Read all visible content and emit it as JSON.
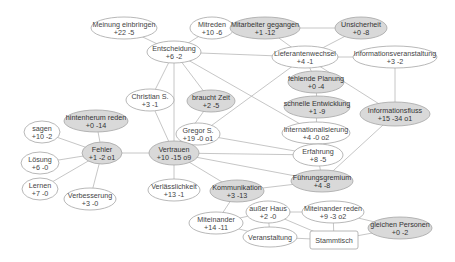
{
  "diagram": {
    "colors": {
      "edge": "#b8b8b8",
      "node_stroke": "#a6a6a6",
      "node_fill_white": "#ffffff",
      "node_fill_gray": "#d9d9d9",
      "text": "#444444"
    },
    "nodes": [
      {
        "id": "meinung",
        "line1": "Meinung einbringen",
        "line2": "+22 -5",
        "x": 124,
        "y": 28,
        "rx": 33,
        "ry": 11,
        "fill": "white"
      },
      {
        "id": "mitreden",
        "line1": "Mitreden",
        "line2": "+10 -6",
        "x": 212,
        "y": 28,
        "rx": 22,
        "ry": 11,
        "fill": "white"
      },
      {
        "id": "mitarbeiter",
        "line1": "Mitarbeiter gegangen",
        "line2": "+1 -12",
        "x": 265,
        "y": 28,
        "rx": 35,
        "ry": 11,
        "fill": "gray"
      },
      {
        "id": "unsicherheit",
        "line1": "Unsicherheit",
        "line2": "+0 -8",
        "x": 361,
        "y": 28,
        "rx": 26,
        "ry": 11,
        "fill": "gray"
      },
      {
        "id": "entscheidung",
        "line1": "Entscheidung",
        "line2": "+6 -2",
        "x": 174,
        "y": 52,
        "rx": 27,
        "ry": 11,
        "fill": "white"
      },
      {
        "id": "lieferanten",
        "line1": "Lieferantenwechsel",
        "line2": "+4 -1",
        "x": 305,
        "y": 57,
        "rx": 33,
        "ry": 11,
        "fill": "white"
      },
      {
        "id": "infoveranst",
        "line1": "Informationsveranstaltung",
        "line2": "+3 -2",
        "x": 395,
        "y": 57,
        "rx": 42,
        "ry": 11,
        "fill": "white"
      },
      {
        "id": "planung",
        "line1": "fehlende Planung",
        "line2": "+0 -4",
        "x": 316,
        "y": 82,
        "rx": 28,
        "ry": 11,
        "fill": "gray"
      },
      {
        "id": "christian",
        "line1": "Christian S.",
        "line2": "+3 -1",
        "x": 150,
        "y": 100,
        "rx": 24,
        "ry": 11,
        "fill": "white"
      },
      {
        "id": "zeit",
        "line1": "braucht Zeit",
        "line2": "+2 -5",
        "x": 211,
        "y": 101,
        "rx": 24,
        "ry": 11,
        "fill": "gray"
      },
      {
        "id": "entwicklung",
        "line1": "schnelle Entwicklung",
        "line2": "+1 -9",
        "x": 317,
        "y": 107,
        "rx": 33,
        "ry": 11,
        "fill": "gray"
      },
      {
        "id": "infofluss",
        "line1": "Informationsfluss",
        "line2": "+15 -34 o1",
        "x": 395,
        "y": 114,
        "rx": 35,
        "ry": 12,
        "fill": "gray"
      },
      {
        "id": "hintenherum",
        "line1": "hintenherum reden",
        "line2": "+0 -14",
        "x": 96,
        "y": 121,
        "rx": 32,
        "ry": 11,
        "fill": "gray"
      },
      {
        "id": "sagen",
        "line1": "sagen",
        "line2": "+10 -2",
        "x": 42,
        "y": 132,
        "rx": 18,
        "ry": 11,
        "fill": "white"
      },
      {
        "id": "gregor",
        "line1": "Gregor S.",
        "line2": "+19 -0 o1",
        "x": 198,
        "y": 134,
        "rx": 22,
        "ry": 11,
        "fill": "white"
      },
      {
        "id": "international",
        "line1": "Internationalisierung",
        "line2": "+4 -0 o2",
        "x": 316,
        "y": 133,
        "rx": 34,
        "ry": 11,
        "fill": "white"
      },
      {
        "id": "fehler",
        "line1": "Fehler",
        "line2": "+1 -2 o1",
        "x": 102,
        "y": 153,
        "rx": 20,
        "ry": 11,
        "fill": "gray"
      },
      {
        "id": "vertrauen",
        "line1": "Vertrauen",
        "line2": "+10 -15 o9",
        "x": 174,
        "y": 153,
        "rx": 25,
        "ry": 12,
        "fill": "gray"
      },
      {
        "id": "erfahrung",
        "line1": "Erfahrung",
        "line2": "+8 -5",
        "x": 318,
        "y": 155,
        "rx": 25,
        "ry": 11,
        "fill": "white"
      },
      {
        "id": "loesung",
        "line1": "Lösung",
        "line2": "+6 -0",
        "x": 40,
        "y": 163,
        "rx": 19,
        "ry": 11,
        "fill": "white"
      },
      {
        "id": "fuehrung",
        "line1": "Führungsgremium",
        "line2": "+4 -8",
        "x": 322,
        "y": 181,
        "rx": 31,
        "ry": 11,
        "fill": "gray"
      },
      {
        "id": "lernen",
        "line1": "Lernen",
        "line2": "+7 -0",
        "x": 40,
        "y": 189,
        "rx": 18,
        "ry": 11,
        "fill": "white"
      },
      {
        "id": "verbesserung",
        "line1": "Verbesserung",
        "line2": "+3 -0",
        "x": 90,
        "y": 199,
        "rx": 26,
        "ry": 11,
        "fill": "white"
      },
      {
        "id": "verlaesslichkeit",
        "line1": "Verlässlichkeit",
        "line2": "+13 -1",
        "x": 174,
        "y": 190,
        "rx": 26,
        "ry": 11,
        "fill": "white"
      },
      {
        "id": "kommunikation",
        "line1": "Kommunikation",
        "line2": "+3 -13",
        "x": 237,
        "y": 191,
        "rx": 27,
        "ry": 11,
        "fill": "gray"
      },
      {
        "id": "ausserhaus",
        "line1": "außer Haus",
        "line2": "+2 -0",
        "x": 268,
        "y": 212,
        "rx": 22,
        "ry": 11,
        "fill": "white"
      },
      {
        "id": "miteinanderreden",
        "line1": "Miteinander reden",
        "line2": "+9 -3 o2",
        "x": 333,
        "y": 212,
        "rx": 31,
        "ry": 11,
        "fill": "white"
      },
      {
        "id": "miteinander",
        "line1": "Miteinander",
        "line2": "+14 -11",
        "x": 216,
        "y": 223,
        "rx": 27,
        "ry": 11,
        "fill": "white"
      },
      {
        "id": "gleichen",
        "line1": "gleichen Personen",
        "line2": "+0 -2",
        "x": 400,
        "y": 228,
        "rx": 32,
        "ry": 11,
        "fill": "gray"
      },
      {
        "id": "veranstaltung",
        "line1": "Veranstaltung",
        "line2": "",
        "x": 270,
        "y": 237,
        "rx": 27,
        "ry": 10,
        "fill": "white"
      },
      {
        "id": "stammtisch",
        "line1": "Stammtisch",
        "line2": "",
        "x": 334,
        "y": 240,
        "w": 48,
        "h": 18,
        "shape": "rect",
        "fill": "white"
      }
    ],
    "edges": [
      [
        "meinung",
        "entscheidung"
      ],
      [
        "mitreden",
        "entscheidung"
      ],
      [
        "entscheidung",
        "lieferanten"
      ],
      [
        "entscheidung",
        "christian"
      ],
      [
        "entscheidung",
        "zeit"
      ],
      [
        "entscheidung",
        "vertrauen"
      ],
      [
        "entscheidung",
        "international"
      ],
      [
        "mitarbeiter",
        "lieferanten"
      ],
      [
        "unsicherheit",
        "lieferanten"
      ],
      [
        "mitarbeiter",
        "unsicherheit"
      ],
      [
        "lieferanten",
        "infoveranst"
      ],
      [
        "lieferanten",
        "planung"
      ],
      [
        "lieferanten",
        "infofluss"
      ],
      [
        "lieferanten",
        "vertrauen"
      ],
      [
        "infoveranst",
        "infofluss"
      ],
      [
        "planung",
        "entwicklung"
      ],
      [
        "entwicklung",
        "international"
      ],
      [
        "international",
        "erfahrung"
      ],
      [
        "infofluss",
        "fuehrung"
      ],
      [
        "christian",
        "vertrauen"
      ],
      [
        "zeit",
        "vertrauen"
      ],
      [
        "gregor",
        "vertrauen"
      ],
      [
        "gregor",
        "erfahrung"
      ],
      [
        "vertrauen",
        "erfahrung"
      ],
      [
        "vertrauen",
        "fuehrung"
      ],
      [
        "vertrauen",
        "kommunikation"
      ],
      [
        "vertrauen",
        "verlaesslichkeit"
      ],
      [
        "vertrauen",
        "fehler"
      ],
      [
        "erfahrung",
        "fuehrung"
      ],
      [
        "kommunikation",
        "fuehrung"
      ],
      [
        "hintenherum",
        "fehler"
      ],
      [
        "sagen",
        "fehler"
      ],
      [
        "loesung",
        "fehler"
      ],
      [
        "lernen",
        "fehler"
      ],
      [
        "verbesserung",
        "fehler"
      ],
      [
        "kommunikation",
        "miteinander"
      ],
      [
        "miteinander",
        "ausserhaus"
      ],
      [
        "miteinander",
        "veranstaltung"
      ],
      [
        "ausserhaus",
        "veranstaltung"
      ],
      [
        "ausserhaus",
        "stammtisch"
      ],
      [
        "ausserhaus",
        "miteinanderreden"
      ],
      [
        "veranstaltung",
        "stammtisch"
      ],
      [
        "miteinanderreden",
        "stammtisch"
      ],
      [
        "miteinanderreden",
        "gleichen"
      ],
      [
        "stammtisch",
        "gleichen"
      ]
    ]
  }
}
